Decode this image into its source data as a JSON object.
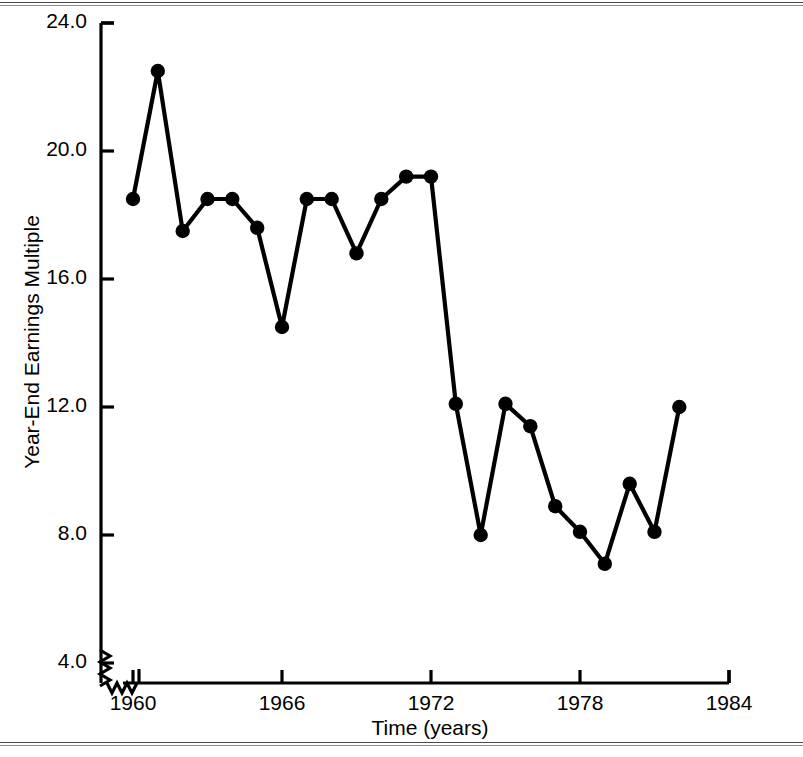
{
  "chart_data": {
    "type": "line",
    "title": "",
    "xlabel": "Time (years)",
    "ylabel": "Year-End Earnings Multiple",
    "xlim": [
      1959,
      1984
    ],
    "ylim": [
      4.0,
      24.0
    ],
    "grid": false,
    "legend": "none",
    "axis_break": {
      "x": true,
      "y": true,
      "note": "zigzag break marks near origin on both axes"
    },
    "xticks": [
      "1960",
      "1966",
      "1972",
      "1978",
      "1984"
    ],
    "xtick_values": [
      1960,
      1966,
      1972,
      1978,
      1984
    ],
    "yticks": [
      "4.0",
      "8.0",
      "12.0",
      "16.0",
      "20.0",
      "24.0"
    ],
    "ytick_values": [
      4.0,
      8.0,
      12.0,
      16.0,
      20.0,
      24.0
    ],
    "marker": "filled-circle",
    "line_color": "#000000",
    "marker_color": "#000000",
    "x": [
      1960,
      1961,
      1962,
      1963,
      1964,
      1965,
      1966,
      1967,
      1968,
      1969,
      1970,
      1971,
      1972,
      1973,
      1974,
      1975,
      1976,
      1977,
      1978,
      1979,
      1980,
      1981
    ],
    "values": [
      18.5,
      22.5,
      17.5,
      18.5,
      18.5,
      17.6,
      14.5,
      18.5,
      18.5,
      16.8,
      18.5,
      19.2,
      19.2,
      12.1,
      8.0,
      12.1,
      11.4,
      8.9,
      8.1,
      7.1,
      9.6,
      8.1
    ],
    "x_secondary": [
      1982
    ],
    "values_secondary": [
      12.0
    ],
    "series": [
      {
        "name": "Year-End Earnings Multiple",
        "points": [
          {
            "x": 1960,
            "y": 18.5
          },
          {
            "x": 1961,
            "y": 22.5
          },
          {
            "x": 1962,
            "y": 17.5
          },
          {
            "x": 1963,
            "y": 18.5
          },
          {
            "x": 1964,
            "y": 18.5
          },
          {
            "x": 1965,
            "y": 17.6
          },
          {
            "x": 1966,
            "y": 14.5
          },
          {
            "x": 1967,
            "y": 18.5
          },
          {
            "x": 1968,
            "y": 18.5
          },
          {
            "x": 1969,
            "y": 16.8
          },
          {
            "x": 1970,
            "y": 18.5
          },
          {
            "x": 1971,
            "y": 19.2
          },
          {
            "x": 1972,
            "y": 19.2
          },
          {
            "x": 1973,
            "y": 12.1
          },
          {
            "x": 1974,
            "y": 8.0
          },
          {
            "x": 1975,
            "y": 12.1
          },
          {
            "x": 1976,
            "y": 11.4
          },
          {
            "x": 1977,
            "y": 8.9
          },
          {
            "x": 1978,
            "y": 8.1
          },
          {
            "x": 1979,
            "y": 7.1
          },
          {
            "x": 1980,
            "y": 9.6
          },
          {
            "x": 1981,
            "y": 8.1
          },
          {
            "x": 1982,
            "y": 12.0
          }
        ]
      }
    ]
  }
}
